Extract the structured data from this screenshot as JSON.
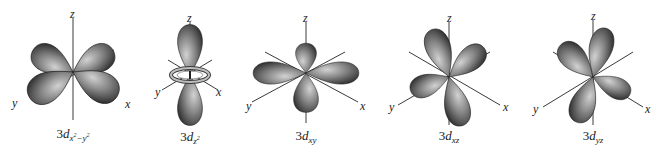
{
  "figure": {
    "colors": {
      "lobe_light": "#c8c8c8",
      "lobe_mid": "#7a7a7a",
      "lobe_dark": "#2e2e2e",
      "axis": "#3a3a3a",
      "background": "#ffffff"
    },
    "axes_labels": {
      "z": "z",
      "y": "y",
      "x": "x"
    },
    "orbitals": [
      {
        "id": "dx2-y2",
        "prefix": "3",
        "d": "d",
        "sub_main": "x",
        "sup1": "2",
        "minus": "−",
        "sub_y": "y",
        "sup2": "2",
        "center": [
          73,
          72
        ]
      },
      {
        "id": "dz2",
        "prefix": "3",
        "d": "d",
        "sub_main": "z",
        "sup1": "2",
        "center": [
          190,
          75
        ]
      },
      {
        "id": "dxy",
        "prefix": "3",
        "d": "d",
        "sub_main": "xy",
        "center": [
          306,
          73
        ]
      },
      {
        "id": "dxz",
        "prefix": "3",
        "d": "d",
        "sub_main": "xz",
        "center": [
          449,
          77
        ]
      },
      {
        "id": "dyz",
        "prefix": "3",
        "d": "d",
        "sub_main": "yz",
        "center": [
          593,
          77
        ]
      }
    ]
  }
}
